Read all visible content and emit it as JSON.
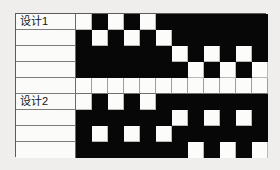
{
  "diagram": {
    "type": "weave-pattern-draft",
    "columns": 12,
    "cell_size_px": 16,
    "colors": {
      "filled": "#070707",
      "empty": "#fcfcfb",
      "border": "#5b5b5b",
      "gridline": "#b9b9b7",
      "page_background": "#efeeec"
    },
    "legend": {
      "filled_meaning": "1",
      "empty_meaning": "0"
    },
    "bands": [
      {
        "id": "design-1",
        "label": "设计1",
        "rows": [
          {
            "label": "设计1",
            "cells": [
              0,
              1,
              0,
              1,
              0,
              1,
              1,
              1,
              1,
              1,
              1,
              1
            ]
          },
          {
            "label": "",
            "cells": [
              1,
              0,
              1,
              0,
              1,
              0,
              1,
              1,
              1,
              1,
              1,
              1
            ]
          },
          {
            "label": "",
            "cells": [
              1,
              1,
              1,
              1,
              1,
              1,
              0,
              1,
              0,
              1,
              0,
              1
            ]
          },
          {
            "label": "",
            "cells": [
              1,
              1,
              1,
              1,
              1,
              1,
              1,
              0,
              1,
              0,
              1,
              0
            ]
          },
          {
            "label": "",
            "separator": true,
            "cells": [
              0,
              0,
              0,
              0,
              0,
              0,
              0,
              0,
              0,
              0,
              0,
              0
            ]
          }
        ]
      },
      {
        "id": "design-2",
        "label": "设计2",
        "rows": [
          {
            "label": "设计2",
            "cells": [
              0,
              1,
              0,
              1,
              0,
              1,
              1,
              1,
              1,
              1,
              1,
              1
            ]
          },
          {
            "label": "",
            "cells": [
              1,
              1,
              1,
              1,
              1,
              1,
              0,
              1,
              0,
              1,
              0,
              1
            ]
          },
          {
            "label": "",
            "cells": [
              1,
              0,
              1,
              0,
              1,
              0,
              1,
              1,
              1,
              1,
              1,
              1
            ]
          },
          {
            "label": "",
            "cells": [
              1,
              1,
              1,
              1,
              1,
              1,
              1,
              0,
              1,
              0,
              1,
              0
            ]
          }
        ]
      }
    ]
  }
}
